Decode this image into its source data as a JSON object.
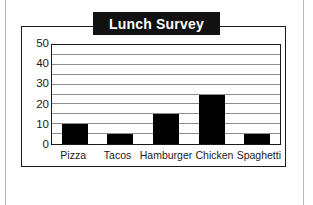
{
  "page": {
    "background_color": "#ffffff",
    "rule_color": "#b9b9b9"
  },
  "figure": {
    "frame_color": "#1a1a1a",
    "title_badge_color": "#111111",
    "title_text_color": "#ffffff"
  },
  "chart_data": {
    "type": "bar",
    "title": "Lunch Survey",
    "subtitle": "",
    "xlabel": "",
    "ylabel": "",
    "categories": [
      "Pizza",
      "Tacos",
      "Hamburger",
      "Chicken",
      "Spaghetti"
    ],
    "values": [
      10,
      5,
      15,
      25,
      5
    ],
    "ylim": [
      0,
      50
    ],
    "ytick_labels": [
      "0",
      "10",
      "20",
      "30",
      "40",
      "50"
    ],
    "ytick_values": [
      0,
      10,
      20,
      30,
      40,
      50
    ],
    "gridline_values": [
      5,
      10,
      15,
      20,
      25,
      30,
      35,
      40,
      45,
      50
    ],
    "grid": true,
    "grid_color": "#8d8d8d",
    "bar_color": "#000000",
    "legend": [],
    "legend_position": "none",
    "annotations": []
  }
}
